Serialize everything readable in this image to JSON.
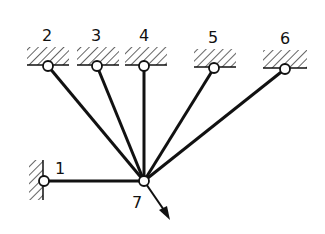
{
  "diagram": {
    "type": "truss / bar structure",
    "nodes": [
      {
        "id": "1",
        "label": "1",
        "x": 44,
        "y": 181,
        "support": "wall-left"
      },
      {
        "id": "2",
        "label": "2",
        "x": 48,
        "y": 66,
        "support": "ceiling"
      },
      {
        "id": "3",
        "label": "3",
        "x": 97,
        "y": 66,
        "support": "ceiling"
      },
      {
        "id": "4",
        "label": "4",
        "x": 144,
        "y": 66,
        "support": "ceiling"
      },
      {
        "id": "5",
        "label": "5",
        "x": 214,
        "y": 68,
        "support": "ceiling"
      },
      {
        "id": "6",
        "label": "6",
        "x": 285,
        "y": 69,
        "support": "ceiling"
      },
      {
        "id": "7",
        "label": "7",
        "x": 144,
        "y": 181,
        "support": "free"
      }
    ],
    "bars": [
      [
        "1",
        "7"
      ],
      [
        "2",
        "7"
      ],
      [
        "3",
        "7"
      ],
      [
        "4",
        "7"
      ],
      [
        "5",
        "7"
      ],
      [
        "6",
        "7"
      ]
    ],
    "load": {
      "at": "7",
      "direction": "down-right",
      "tip_x": 170,
      "tip_y": 220
    },
    "colors": {
      "line": "#111111",
      "background": "#ffffff"
    }
  }
}
